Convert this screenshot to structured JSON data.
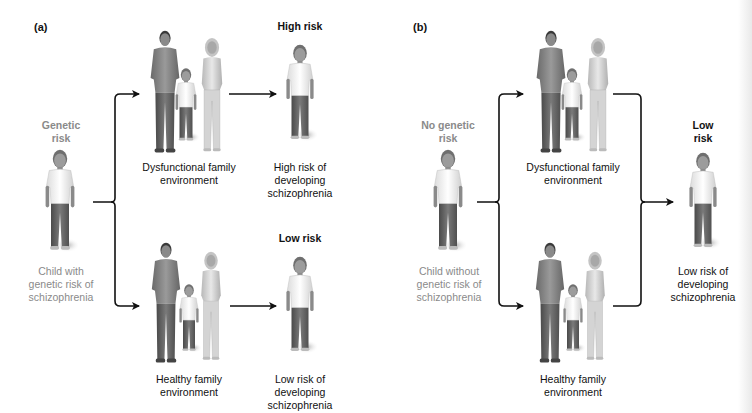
{
  "panels": [
    {
      "id": "a",
      "label": "(a)",
      "start": {
        "heading": [
          "Genetic",
          "risk"
        ],
        "caption": [
          "Child with",
          "genetic risk of",
          "schizophrenia"
        ]
      },
      "top_branch": {
        "environment": [
          "Dysfunctional family",
          "environment"
        ],
        "outcome_heading": "High risk",
        "outcome_caption": [
          "High risk of",
          "developing",
          "schizophrenia"
        ]
      },
      "bottom_branch": {
        "environment": [
          "Healthy family",
          "environment"
        ],
        "outcome_heading": "Low risk",
        "outcome_caption": [
          "Low risk of",
          "developing",
          "schizophrenia"
        ]
      }
    },
    {
      "id": "b",
      "label": "(b)",
      "start": {
        "heading": [
          "No genetic",
          "risk"
        ],
        "caption": [
          "Child without",
          "genetic risk of",
          "schizophrenia"
        ]
      },
      "top_branch": {
        "environment": [
          "Dysfunctional family",
          "environment"
        ]
      },
      "bottom_branch": {
        "environment": [
          "Healthy family",
          "environment"
        ]
      },
      "outcome": {
        "heading": [
          "Low",
          "risk"
        ],
        "caption": [
          "Low risk of",
          "developing",
          "schizophrenia"
        ]
      }
    }
  ],
  "colors": {
    "text": "#111111",
    "muted_text": "#8a8a8a",
    "arrow": "#111111"
  }
}
